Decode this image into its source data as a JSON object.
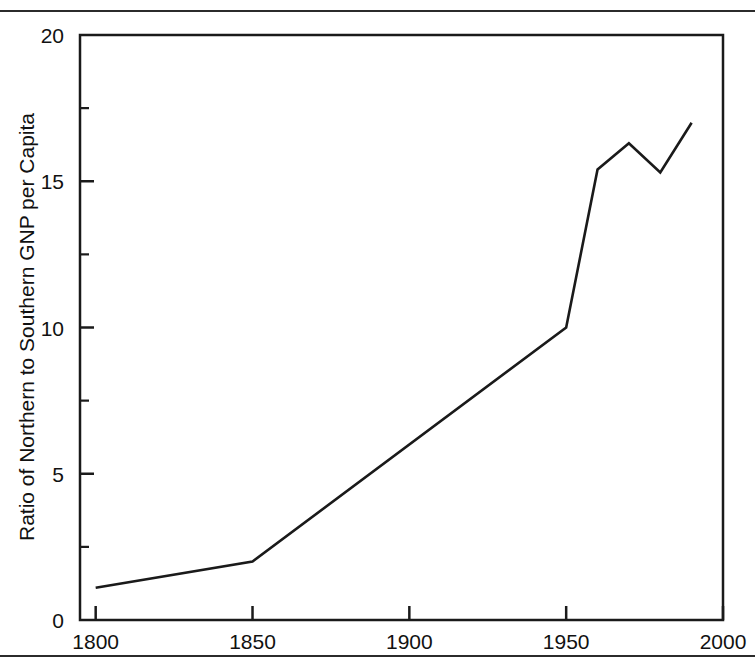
{
  "figure": {
    "background_color": "#ffffff",
    "line_color": "#1a1a1a",
    "axis_color": "#1a1a1a",
    "rule_top_label": "top-rule",
    "rule_bottom_label": "bottom-rule"
  },
  "chart_data": {
    "type": "line",
    "title": "",
    "subtitle": "",
    "xlabel": "",
    "ylabel": "Ratio of Northern to Southern GNP per Capita",
    "xlim": [
      1795,
      2000
    ],
    "ylim": [
      0,
      20
    ],
    "grid": false,
    "legend": "none",
    "x_ticks": [
      1800,
      1850,
      1900,
      1950,
      2000
    ],
    "x_tick_labels": [
      "1800",
      "1850",
      "1900",
      "1950",
      "2000"
    ],
    "x_minor_ticks": [],
    "y_ticks": [
      0,
      5,
      10,
      15,
      20
    ],
    "y_tick_labels": [
      "0",
      "5",
      "10",
      "15",
      "20"
    ],
    "y_minor_ticks": [
      2.5,
      7.5,
      12.5,
      17.5
    ],
    "series": [
      {
        "name": "Ratio of Northern to Southern GNP per Capita",
        "x": [
          1800,
          1850,
          1950,
          1960,
          1970,
          1980,
          1990
        ],
        "values": [
          1.1,
          2.0,
          10.0,
          15.4,
          16.3,
          15.3,
          17.0
        ]
      }
    ]
  }
}
